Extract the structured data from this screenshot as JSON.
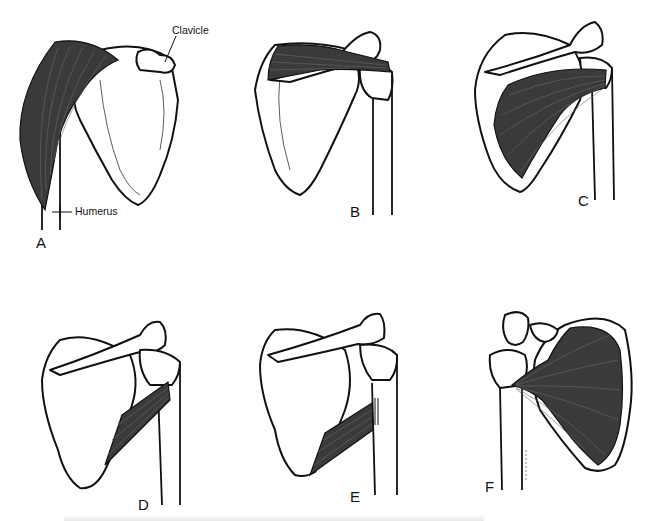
{
  "figure": {
    "panels": [
      {
        "id": "A",
        "label": "A",
        "muscle": "deltoid"
      },
      {
        "id": "B",
        "label": "B",
        "muscle": "supraspinatus"
      },
      {
        "id": "C",
        "label": "C",
        "muscle": "infraspinatus"
      },
      {
        "id": "D",
        "label": "D",
        "muscle": "teres minor"
      },
      {
        "id": "E",
        "label": "E",
        "muscle": "teres major"
      },
      {
        "id": "F",
        "label": "F",
        "muscle": "subscapularis"
      }
    ],
    "annotations": {
      "clavicle": "Clavicle",
      "humerus": "Humerus"
    },
    "colors": {
      "muscle_fill": "#3a3a3a",
      "outline": "#111111",
      "background": "#ffffff"
    }
  }
}
